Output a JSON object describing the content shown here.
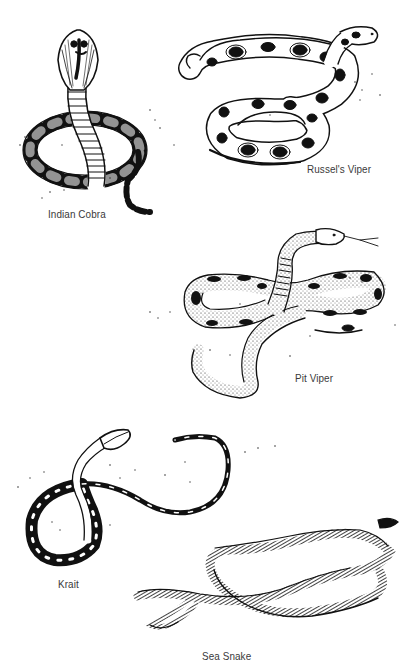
{
  "figure": {
    "ink_color": "#1a1a1a",
    "label_color": "#3a3a3a",
    "background": "#ffffff"
  },
  "snakes": [
    {
      "name": "Indian Cobra",
      "label_pos": [
        48,
        208
      ]
    },
    {
      "name": "Russel's Viper",
      "label_pos": [
        307,
        163
      ]
    },
    {
      "name": "Pit Viper",
      "label_pos": [
        295,
        372
      ]
    },
    {
      "name": "Krait",
      "label_pos": [
        58,
        578
      ]
    },
    {
      "name": "Sea Snake",
      "label_pos": [
        202,
        650
      ]
    }
  ]
}
